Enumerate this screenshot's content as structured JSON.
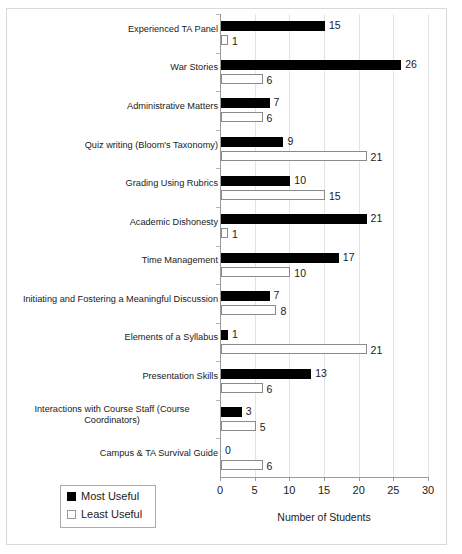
{
  "chart_data": {
    "type": "bar",
    "orientation": "horizontal",
    "title": "",
    "xlabel": "Number of Students",
    "ylabel": "",
    "xlim": [
      0,
      30
    ],
    "xticks": [
      0,
      5,
      10,
      15,
      20,
      25,
      30
    ],
    "grid": true,
    "legend_position": "bottom-left",
    "categories": [
      "Experienced TA Panel",
      "War Stories",
      "Administrative Matters",
      "Quiz writing (Bloom's Taxonomy)",
      "Grading Using Rubrics",
      "Academic Dishonesty",
      "Time Management",
      "Initiating and Fostering a Meaningful Discussion",
      "Elements of a Syllabus",
      "Presentation Skills",
      "Interactions with Course Staff (Course Coordinators)",
      "Campus & TA Survival Guide"
    ],
    "category_lines": [
      [
        "Experienced TA Panel"
      ],
      [
        "War Stories"
      ],
      [
        "Administrative Matters"
      ],
      [
        "Quiz writing (Bloom's Taxonomy)"
      ],
      [
        "Grading Using Rubrics"
      ],
      [
        "Academic Dishonesty"
      ],
      [
        "Time Management"
      ],
      [
        "Initiating and Fostering a Meaningful Discussion"
      ],
      [
        "Elements of a Syllabus"
      ],
      [
        "Presentation Skills"
      ],
      [
        "Interactions with Course Staff (Course",
        "Coordinators)"
      ],
      [
        "Campus & TA Survival Guide"
      ]
    ],
    "series": [
      {
        "name": "Most Useful",
        "color": "#000000",
        "values": [
          15,
          26,
          7,
          9,
          10,
          21,
          17,
          7,
          1,
          13,
          3,
          0
        ]
      },
      {
        "name": "Least Useful",
        "color": "#ffffff",
        "values": [
          1,
          6,
          6,
          21,
          15,
          1,
          10,
          8,
          21,
          6,
          5,
          6
        ]
      }
    ]
  },
  "legend": {
    "items": [
      {
        "label": "Most Useful",
        "style": "most"
      },
      {
        "label": "Least Useful",
        "style": "least"
      }
    ]
  },
  "axis": {
    "x_title": "Number of Students",
    "tick_labels": [
      "0",
      "5",
      "10",
      "15",
      "20",
      "25",
      "30"
    ]
  }
}
